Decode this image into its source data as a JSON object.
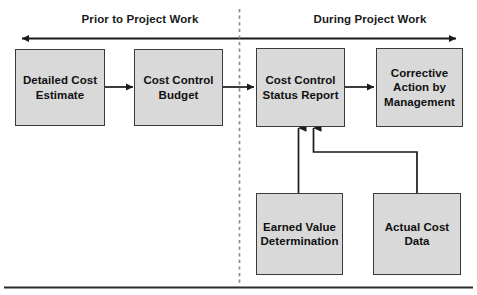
{
  "diagram": {
    "title_top_left": "Prior to Project Work",
    "title_top_right": "During Project Work",
    "phases": [
      {
        "id": "prior",
        "label": "Prior to Project Work"
      },
      {
        "id": "during",
        "label": "During Project Work"
      }
    ],
    "nodes": [
      {
        "id": "detailed-cost-estimate",
        "label": "Detailed Cost\nEstimate"
      },
      {
        "id": "cost-control-budget",
        "label": "Cost Control\nBudget"
      },
      {
        "id": "cost-control-status-report",
        "label": "Cost Control\nStatus Report"
      },
      {
        "id": "corrective-action-by-management",
        "label": "Corrective\nAction by\nManagement"
      },
      {
        "id": "earned-value-determination",
        "label": "Earned Value\nDetermination"
      },
      {
        "id": "actual-cost-data",
        "label": "Actual Cost\nData"
      }
    ],
    "connectors": [
      {
        "id": "estimate-to-budget",
        "from": "detailed-cost-estimate",
        "to": "cost-control-budget",
        "style": "arrow-right"
      },
      {
        "id": "budget-to-status",
        "from": "cost-control-budget",
        "to": "cost-control-status-report",
        "style": "arrow-right"
      },
      {
        "id": "status-to-corrective",
        "from": "cost-control-status-report",
        "to": "corrective-action-by-management",
        "style": "arrow-right"
      },
      {
        "id": "earned-value-to-status",
        "from": "earned-value-determination",
        "to": "cost-control-status-report",
        "style": "arrow-up"
      },
      {
        "id": "actual-cost-to-status",
        "from": "actual-cost-data",
        "to": "cost-control-status-report",
        "style": "arrow-up-elbow"
      }
    ],
    "timeline_axis": {
      "id": "timeline-double-arrow",
      "style": "double-headed-horizontal-arrow"
    },
    "phase_divider": {
      "id": "phase-divider",
      "style": "vertical-dashed-line"
    },
    "footer_rule": {
      "id": "footer-rule",
      "style": "horizontal-rule"
    },
    "colors": {
      "box_fill": "#d9d9d9",
      "box_border": "#3a3a3a",
      "line": "#1a1a1a",
      "divider": "#8c8c8c",
      "text": "#101010"
    }
  }
}
